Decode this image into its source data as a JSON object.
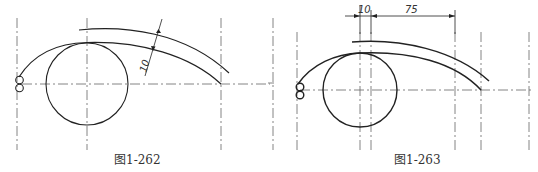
{
  "figures": [
    {
      "id": "left",
      "caption": "图1-262",
      "dimensions": [
        {
          "label": "10",
          "type": "radial-offset"
        }
      ]
    },
    {
      "id": "right",
      "caption": "图1-263",
      "dimensions": [
        {
          "label": "10",
          "type": "horizontal"
        },
        {
          "label": "75",
          "type": "horizontal"
        }
      ]
    }
  ],
  "colors": {
    "stroke": "#222222",
    "centerline": "#555555",
    "background": "#ffffff"
  }
}
